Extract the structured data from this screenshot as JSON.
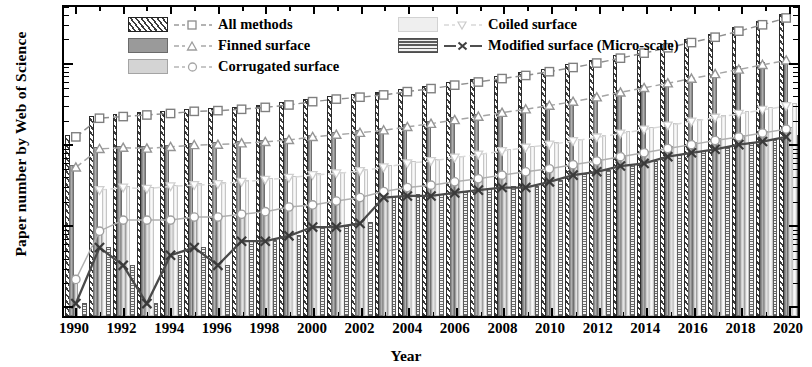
{
  "chart_data": {
    "type": "bar",
    "title": "",
    "xlabel": "Year",
    "ylabel": "Paper number by Web of Science",
    "yscale": "log",
    "ylim": [
      0.7,
      5000
    ],
    "ytick_labels": [
      "1",
      "10",
      "100",
      "1000"
    ],
    "ytick_values": [
      1,
      10,
      100,
      1000
    ],
    "grid": false,
    "legend_position": "top-left",
    "categories": [
      1990,
      1991,
      1992,
      1993,
      1994,
      1995,
      1996,
      1997,
      1998,
      1999,
      2000,
      2001,
      2002,
      2003,
      2004,
      2005,
      2006,
      2007,
      2008,
      2009,
      2010,
      2011,
      2012,
      2013,
      2014,
      2015,
      2016,
      2017,
      2018,
      2019,
      2020
    ],
    "xtick_labels": [
      "1990",
      "1992",
      "1994",
      "1996",
      "1998",
      "2000",
      "2002",
      "2004",
      "2006",
      "2008",
      "2010",
      "2012",
      "2014",
      "2016",
      "2018",
      "2020"
    ],
    "series": [
      {
        "name": "All methods",
        "marker": "square",
        "line": "dashed",
        "values": [
          120,
          205,
          215,
          225,
          235,
          250,
          255,
          265,
          280,
          300,
          330,
          355,
          375,
          400,
          440,
          480,
          530,
          580,
          640,
          700,
          780,
          880,
          1000,
          1150,
          1330,
          1550,
          1800,
          2100,
          2500,
          3000,
          3650
        ]
      },
      {
        "name": "Finned surface",
        "marker": "triangle-up",
        "line": "dashed",
        "values": [
          50,
          85,
          88,
          86,
          90,
          95,
          96,
          100,
          104,
          110,
          120,
          128,
          135,
          145,
          160,
          175,
          195,
          215,
          240,
          265,
          295,
          330,
          375,
          430,
          490,
          560,
          640,
          730,
          830,
          950,
          1080
        ]
      },
      {
        "name": "Corrugated surface",
        "marker": "circle",
        "line": "solid",
        "values": [
          2,
          8,
          11,
          11,
          11,
          12,
          12,
          13,
          14,
          16,
          17,
          19,
          21,
          25,
          28,
          30,
          33,
          36,
          40,
          44,
          48,
          54,
          60,
          68,
          76,
          86,
          96,
          108,
          120,
          134,
          150
        ]
      },
      {
        "name": "Coiled surface",
        "marker": "triangle-down",
        "line": "dashed",
        "values": [
          null,
          26,
          28,
          27,
          29,
          30,
          31,
          33,
          35,
          37,
          40,
          42,
          45,
          50,
          56,
          60,
          66,
          72,
          80,
          88,
          96,
          106,
          118,
          132,
          148,
          166,
          186,
          208,
          232,
          260,
          290
        ]
      },
      {
        "name": "Modified surface (Micro-scale)",
        "marker": "x",
        "line": "solid",
        "values": [
          1,
          5,
          3,
          1,
          4,
          5,
          3,
          6,
          6,
          7,
          9,
          9,
          10,
          21,
          22,
          22,
          24,
          26,
          28,
          28,
          33,
          40,
          44,
          52,
          56,
          68,
          76,
          84,
          96,
          105,
          120
        ]
      }
    ],
    "bar_series_order": [
      "All methods",
      "Finned surface",
      "Corrugated surface",
      "Coiled surface",
      "Modified surface (Micro-scale)"
    ]
  },
  "legend": {
    "items": [
      {
        "label": "All methods",
        "swatch": "diagonal-hatch",
        "marker": "square"
      },
      {
        "label": "Coiled surface",
        "swatch": "very-light-fill",
        "marker": "triangle-down"
      },
      {
        "label": "Finned surface",
        "swatch": "dark-fill",
        "marker": "triangle-up"
      },
      {
        "label": "Modified surface (Micro-scale)",
        "swatch": "horizontal-lines",
        "marker": "x"
      },
      {
        "label": "Corrugated surface",
        "swatch": "light-fill",
        "marker": "circle"
      }
    ]
  },
  "colors": {
    "axis": "#000000",
    "all_methods": "#3c3c3c",
    "finned": "#8a8a8a",
    "corrugated": "#b8b8b8",
    "coiled": "#dcdcdc",
    "modified": "#5a5a5a"
  }
}
